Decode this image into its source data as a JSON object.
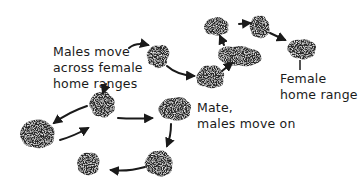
{
  "diagram": {
    "labels": {
      "males_move_line1": "Males  move",
      "males_move_line2": "across female",
      "males_move_line3": "home ranges",
      "mate_line1": "Mate,",
      "mate_line2": "males move on",
      "female_line1": "Female",
      "female_line2": "home range"
    },
    "colors": {
      "blob": "#2a2a2a",
      "arrow": "#1a1a1a",
      "background": "#ffffff"
    },
    "home_ranges": [
      {
        "id": "hr1",
        "cx": 158,
        "cy": 57
      },
      {
        "id": "hr2",
        "cx": 211,
        "cy": 77
      },
      {
        "id": "hr3",
        "cx": 244,
        "cy": 54
      },
      {
        "id": "hr4",
        "cx": 216,
        "cy": 26
      },
      {
        "id": "hr5",
        "cx": 259,
        "cy": 27
      },
      {
        "id": "hr6",
        "cx": 301,
        "cy": 49
      },
      {
        "id": "hr7",
        "cx": 101,
        "cy": 104
      },
      {
        "id": "hr8",
        "cx": 38,
        "cy": 133
      },
      {
        "id": "hr9",
        "cx": 175,
        "cy": 110
      },
      {
        "id": "hr10",
        "cx": 160,
        "cy": 163
      },
      {
        "id": "hr11",
        "cx": 90,
        "cy": 163
      }
    ]
  }
}
